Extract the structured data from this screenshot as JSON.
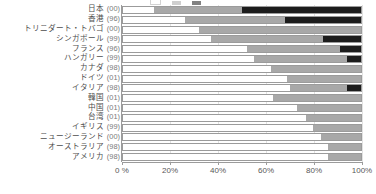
{
  "chart_data": {
    "type": "bar",
    "orientation": "horizontal",
    "stacked": true,
    "stack_mode": "percent",
    "title": "",
    "xlabel": "",
    "ylabel": "",
    "xlim": [
      0,
      100
    ],
    "grid": true,
    "legend_position": "top",
    "xticks": [
      "0 %",
      "20%",
      "40%",
      "60%",
      "80%",
      "100%"
    ],
    "xtick_values": [
      0,
      20,
      40,
      60,
      80,
      100
    ],
    "series": [
      {
        "name": "",
        "color": "#ffffff",
        "values": [
          13,
          26,
          32,
          37,
          52,
          55,
          62,
          69,
          70,
          63,
          73,
          77,
          80,
          83,
          86,
          86
        ]
      },
      {
        "name": "",
        "color": "#a8a8a8",
        "values": [
          37,
          42,
          68,
          47,
          39,
          39,
          38,
          31,
          24,
          37,
          27,
          23,
          20,
          17,
          14,
          14
        ]
      },
      {
        "name": "",
        "color": "#1c1c1c",
        "values": [
          50,
          32,
          0,
          16,
          9,
          6,
          0,
          0,
          6,
          0,
          0,
          0,
          0,
          0,
          0,
          0
        ]
      }
    ],
    "categories": [
      {
        "name": "日本",
        "year": "(00)"
      },
      {
        "name": "香港",
        "year": "(96)"
      },
      {
        "name": "トリニダート・トバゴ",
        "year": "(00)"
      },
      {
        "name": "シンガポール",
        "year": "(99)"
      },
      {
        "name": "フランス",
        "year": "(96)"
      },
      {
        "name": "ハンガリー",
        "year": "(99)"
      },
      {
        "name": "カナダ",
        "year": "(98)"
      },
      {
        "name": "ドイツ",
        "year": "(01)"
      },
      {
        "name": "イタリア",
        "year": "(98)"
      },
      {
        "name": "韓国",
        "year": "(01)"
      },
      {
        "name": "中国",
        "year": "(01)"
      },
      {
        "name": "台湾",
        "year": "(01)"
      },
      {
        "name": "イギリス",
        "year": "(99)"
      },
      {
        "name": "ニュージーランド",
        "year": "(00)"
      },
      {
        "name": "オーストラリア",
        "year": "(98)"
      },
      {
        "name": "アメリカ",
        "year": "(98)"
      }
    ]
  }
}
